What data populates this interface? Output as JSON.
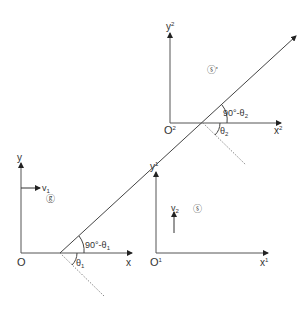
{
  "frames": {
    "ground": {
      "origin": "O",
      "x_axis": "x",
      "y_axis": "y",
      "symbol": "ⓖ",
      "velocity_label": "v",
      "velocity_sub": "1"
    },
    "frame1": {
      "origin": "O",
      "origin_sup": "1",
      "x_axis": "x",
      "x_sup": "1",
      "y_axis": "y",
      "y_sup": "1",
      "symbol": "ⓢ",
      "velocity_label": "v",
      "velocity_sub": "2"
    },
    "frame2": {
      "origin": "O",
      "origin_sup": "2",
      "x_axis": "x",
      "x_sup": "2",
      "y_axis": "y",
      "y_sup": "2",
      "symbol": "ⓢ'"
    }
  },
  "angles": {
    "lower_complement": "90°-θ",
    "lower_complement_sub": "1",
    "lower_angle": "θ",
    "lower_angle_sub": "1",
    "upper_complement": "90°-θ",
    "upper_complement_sub": "2",
    "upper_angle": "θ",
    "upper_angle_sub": "2"
  }
}
